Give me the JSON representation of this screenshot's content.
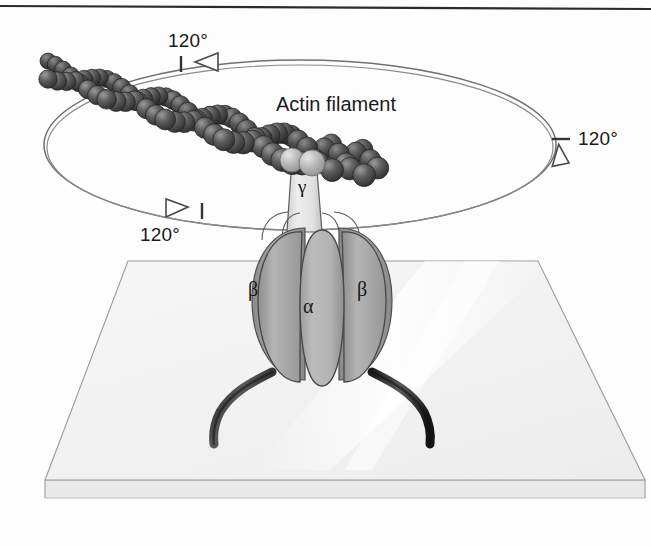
{
  "figure": {
    "top_rule": true,
    "background_color": "#fdfdfd"
  },
  "labels": {
    "angle_top": "120°",
    "angle_right": "120°",
    "angle_bottom": "120°",
    "actin_filament": "Actin filament",
    "gamma": "γ",
    "beta_left": "β",
    "alpha": "α",
    "beta_right": "β"
  },
  "colors": {
    "outline": "#3a3a3a",
    "orbit_line": "#6e6e6e",
    "actin_bead_dark": "#555555",
    "actin_bead_darkest": "#3d3d3d",
    "actin_bead_light": "#b9b9b9",
    "subunit_fill": "#b0b0b0",
    "subunit_fill_dark": "#9a9a9a",
    "gamma_fill": "#e2e2e2",
    "slide_fill": "#f2f2f2",
    "slide_edge": "#e2e2e2",
    "anchor_leg": "#252525",
    "text": "#1a1a1a"
  },
  "geometry": {
    "orbit_ellipse": {
      "cx": 300,
      "cy": 145,
      "rx": 256,
      "ry": 85
    },
    "slide_quad": [
      [
        128,
        261
      ],
      [
        538,
        261
      ],
      [
        645,
        480
      ],
      [
        45,
        480
      ]
    ],
    "slide_thickness": 18,
    "gamma_stalk": {
      "x": 290,
      "y": 160,
      "width": 28,
      "height": 72
    },
    "f1_head": {
      "cx": 322,
      "cy": 300,
      "rx": 72,
      "ry": 82
    }
  },
  "chart_data": {
    "type": "diagram",
    "elements": [
      {
        "name": "actin filament",
        "label": "Actin filament",
        "description": "double-helical chain of dark spheres attached to gamma subunit"
      },
      {
        "name": "gamma subunit",
        "label": "γ",
        "description": "central rotating stalk"
      },
      {
        "name": "alpha subunit",
        "label": "α",
        "count": 3
      },
      {
        "name": "beta subunit",
        "label": "β",
        "count": 3
      },
      {
        "name": "glass slide",
        "description": "coverslip surface anchoring the enzyme"
      },
      {
        "name": "his-tag anchors",
        "count": 2
      }
    ],
    "rotation_steps_deg": [
      120,
      120,
      120
    ],
    "rotation_direction": "counterclockwise viewed from above",
    "annotations": [
      "120°",
      "120°",
      "120°",
      "Actin filament"
    ]
  }
}
